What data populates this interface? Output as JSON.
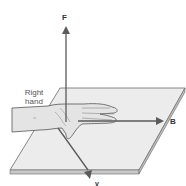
{
  "diagram": {
    "labels": {
      "force": "F",
      "field": "B",
      "velocity": "v",
      "hand_line1": "Right",
      "hand_line2": "hand"
    },
    "colors": {
      "arrow": "#5a5a5a",
      "plane_fill": "#ececec",
      "plane_edge": "#6a6a6a",
      "plane_side": "#c8c8c8",
      "hand_fill": "#e4e4e4",
      "hand_line": "#555555"
    }
  }
}
